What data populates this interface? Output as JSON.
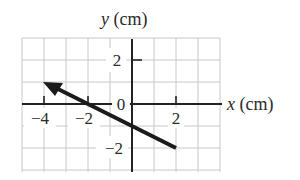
{
  "diagram": {
    "type": "vector-on-grid",
    "x_axis_label_var": "x",
    "x_axis_label_unit": " (cm)",
    "y_axis_label_var": "y",
    "y_axis_label_unit": " (cm)",
    "x_tick_labels": [
      "−4",
      "−2",
      "0",
      "2"
    ],
    "y_tick_labels": [
      "2",
      "−2"
    ],
    "origin_label": "0",
    "grid": {
      "x_min": -5,
      "x_max": 4,
      "y_min": -3,
      "y_max": 3,
      "step": 1
    },
    "vector": {
      "tail": [
        2,
        -2
      ],
      "head": [
        -4,
        1
      ]
    },
    "colors": {
      "grid": "#c8c8c8",
      "axis": "#222222",
      "vector": "#1a1a1a",
      "text": "#2a2a2a"
    }
  }
}
